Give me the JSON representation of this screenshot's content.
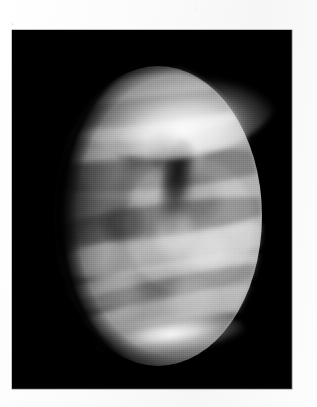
{
  "figure": {
    "kind": "astronomical-photograph",
    "modality": "ultraviolet cloud-top image",
    "presentation": "grayscale plate on a white printed page",
    "panel": {
      "background_color": "#000000",
      "border_color": "#8e8e8e"
    },
    "page": {
      "background_color": "#ffffff"
    },
    "caption": ""
  },
  "disk": {
    "phase": "gibbous",
    "illumination_direction": "right",
    "terminator_edge": "left",
    "surface_tone_range": {
      "darkest": "#1a1a1a",
      "brightest": "#f0f0f0"
    }
  },
  "features": [
    {
      "name": "north-polar-collar",
      "type": "bright band",
      "position": "top",
      "description": "bright arcing cloud collar across the northern limb"
    },
    {
      "name": "mid-latitude-banding",
      "type": "bright bands",
      "position": "center",
      "description": "streaked latitudinal cloud bands sweeping from the terminator toward the limb"
    },
    {
      "name": "dark-y-feature",
      "type": "dark marking",
      "position": "center-right",
      "description": "dark vertical streak forming the stem of the classic Venusian Y"
    },
    {
      "name": "mottled-cells",
      "type": "texture",
      "position": "mid-latitudes",
      "description": "mottled light and dark convective cloud cells"
    },
    {
      "name": "south-polar-streak",
      "type": "bright band",
      "position": "bottom",
      "description": "bright narrow streak along the southern limb"
    },
    {
      "name": "limb-brightening",
      "type": "bright rim",
      "position": "right",
      "description": "brightened crescent along the sunlit limb"
    }
  ]
}
